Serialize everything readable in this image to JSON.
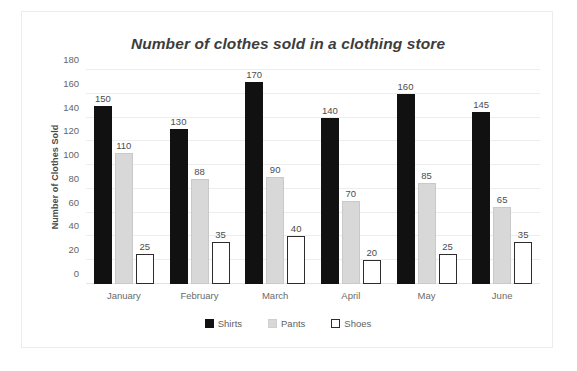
{
  "chart_data": {
    "type": "bar",
    "title": "Number of clothes sold in a clothing store",
    "xlabel": "",
    "ylabel": "Number of Clothes Sold",
    "categories": [
      "January",
      "February",
      "March",
      "April",
      "May",
      "June"
    ],
    "series": [
      {
        "name": "Shirts",
        "color": "#111111",
        "values": [
          150,
          130,
          170,
          140,
          160,
          145
        ]
      },
      {
        "name": "Pants",
        "color": "#d8d8d8",
        "values": [
          110,
          88,
          90,
          70,
          85,
          65
        ]
      },
      {
        "name": "Shoes",
        "color": "#ffffff",
        "values": [
          25,
          35,
          40,
          20,
          25,
          35
        ]
      }
    ],
    "ylim": [
      0,
      180
    ],
    "yticks": [
      0,
      20,
      40,
      60,
      80,
      100,
      120,
      140,
      160,
      180
    ],
    "grid": true,
    "legend_position": "bottom",
    "data_labels": true
  }
}
